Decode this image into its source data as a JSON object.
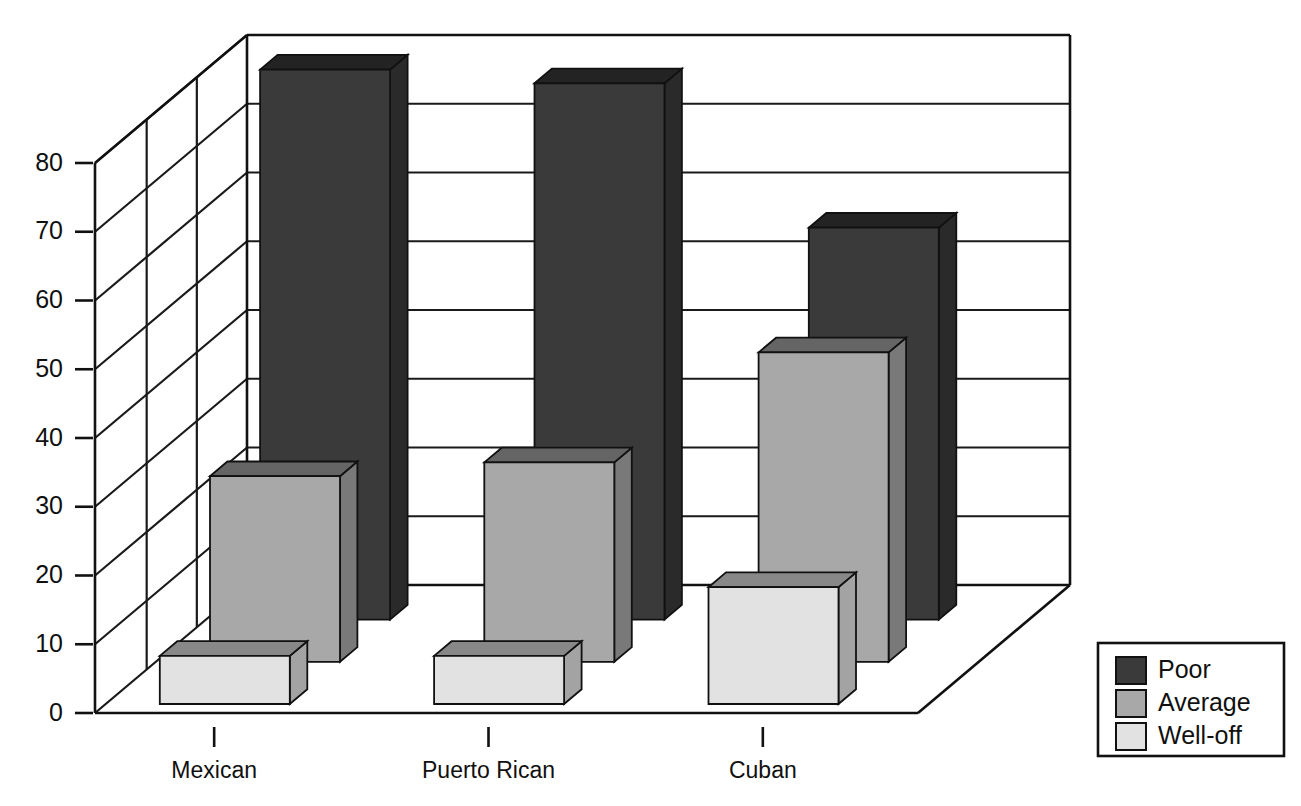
{
  "chart_data": {
    "type": "bar",
    "title": "",
    "subtitle": "",
    "xlabel": "",
    "ylabel": "",
    "categories": [
      "Mexican",
      "Puerto Rican",
      "Cuban"
    ],
    "series": [
      {
        "name": "Poor",
        "values": [
          80,
          78,
          57
        ],
        "color": "#3a3a3a"
      },
      {
        "name": "Average",
        "values": [
          27,
          29,
          45
        ],
        "color": "#a8a8a8"
      },
      {
        "name": "Well-off",
        "values": [
          7,
          7,
          17
        ],
        "color": "#e2e2e2"
      }
    ],
    "ylim": [
      0,
      80
    ],
    "ytick_labels": [
      "80",
      "70",
      "60",
      "50",
      "40",
      "30",
      "20",
      "10",
      "0"
    ],
    "ytick_values": [
      80,
      70,
      60,
      50,
      40,
      30,
      20,
      10,
      0
    ],
    "grid": true,
    "grid_axis": "y",
    "legend_position": "bottom-right",
    "projection": "3d",
    "depth_order": [
      "Poor",
      "Average",
      "Well-off"
    ]
  },
  "legend": {
    "items": [
      {
        "label": "Poor",
        "color": "#3a3a3a"
      },
      {
        "label": "Average",
        "color": "#a8a8a8"
      },
      {
        "label": "Well-off",
        "color": "#e2e2e2"
      }
    ]
  },
  "axis": {
    "y_ticks": [
      "80",
      "70",
      "60",
      "50",
      "40",
      "30",
      "20",
      "10",
      "0"
    ],
    "x_ticks": [
      "Mexican",
      "Puerto Rican",
      "Cuban"
    ]
  }
}
